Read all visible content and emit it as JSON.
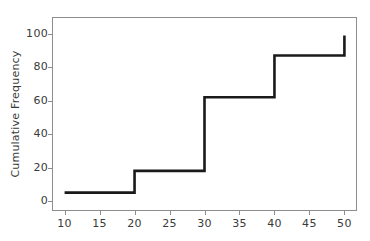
{
  "chart_data": {
    "type": "line",
    "subtype": "step-post",
    "title": "",
    "subtitle": "",
    "xlabel": "",
    "ylabel": "Cumulative Frequency",
    "xlim": [
      8.2,
      51.8
    ],
    "ylim": [
      -6,
      110
    ],
    "grid": false,
    "legend": null,
    "annotations": [],
    "x_ticks": [
      10,
      15,
      20,
      25,
      30,
      35,
      40,
      45,
      50
    ],
    "x_tick_labels": [
      "10",
      "15",
      "20",
      "25",
      "30",
      "35",
      "40",
      "45",
      "50"
    ],
    "y_ticks": [
      0,
      20,
      40,
      60,
      80,
      100
    ],
    "y_tick_labels": [
      "0",
      "20",
      "40",
      "60",
      "80",
      "100"
    ],
    "series": [
      {
        "name": "Cumulative Frequency",
        "color": "#1a1a1a",
        "line_width": 2.6,
        "x": [
          10,
          20,
          20,
          30,
          30,
          40,
          40,
          50,
          50
        ],
        "values": [
          5,
          5,
          18,
          18,
          62,
          62,
          87,
          87,
          99
        ]
      }
    ],
    "steps": [
      {
        "from_x": 10,
        "to_x": 20,
        "level": 5
      },
      {
        "from_x": 20,
        "to_x": 30,
        "level": 18
      },
      {
        "from_x": 30,
        "to_x": 40,
        "level": 62
      },
      {
        "from_x": 40,
        "to_x": 50,
        "level": 87
      },
      {
        "from_x": 50,
        "to_x": 50,
        "level": 99
      }
    ]
  },
  "axes": {
    "ylabel": "Cumulative Frequency",
    "frame_color": "#8d8d8d",
    "tick_color": "#8d8d8d",
    "label_color": "#3a3a3a"
  }
}
